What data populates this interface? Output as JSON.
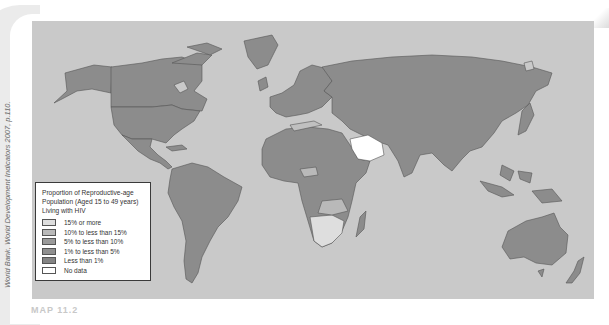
{
  "map": {
    "title": "Proportion of Reproductive-age Population (Aged 15 to 49 years) Living with HIV",
    "colors": {
      "ocean": "#c9c9c9",
      "land_default": "#8c8c8c",
      "border": "#555555"
    }
  },
  "legend": {
    "title_line1": "Proportion of Reproductive-age",
    "title_line2": "Population (Aged 15 to 49 years)",
    "title_line3": "Living with HIV",
    "items": [
      {
        "label": "15% or more",
        "color": "#dedede"
      },
      {
        "label": "10% to less than 15%",
        "color": "#b9b9b9"
      },
      {
        "label": "5% to less than 10%",
        "color": "#9a9a9a"
      },
      {
        "label": "1% to less than 5%",
        "color": "#8f8f8f"
      },
      {
        "label": "Less than 1%",
        "color": "#848484"
      },
      {
        "label": "No data",
        "color": "#ffffff"
      }
    ]
  },
  "source_credit": "World Bank, World Development Indicators 2007, p.110.",
  "footer_fragment": "MAP 11.2"
}
